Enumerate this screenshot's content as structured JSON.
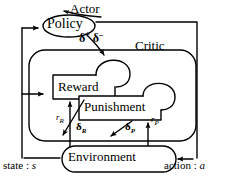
{
  "diagram": {
    "nodes": {
      "actor_label": "Actor",
      "policy": "Policy",
      "critic_label": "Critic",
      "reward": "Reward",
      "punishment": "Punishment",
      "environment": "Environment"
    },
    "signals": {
      "delta_plus": "δ",
      "delta_plus_sup": "+",
      "delta_minus": "δ",
      "delta_minus_sup": "–",
      "r_reward": "r",
      "r_reward_sub": "R",
      "delta_reward": "δ",
      "delta_reward_sub": "R",
      "delta_punish": "δ",
      "delta_punish_sub": "P",
      "r_punish": "r",
      "r_punish_sub": "P"
    },
    "io": {
      "state_text": "state : ",
      "state_var": "s",
      "action_text": "action : ",
      "action_var": "a"
    },
    "colors": {
      "stroke": "#000000",
      "background": "#ffffff"
    }
  }
}
